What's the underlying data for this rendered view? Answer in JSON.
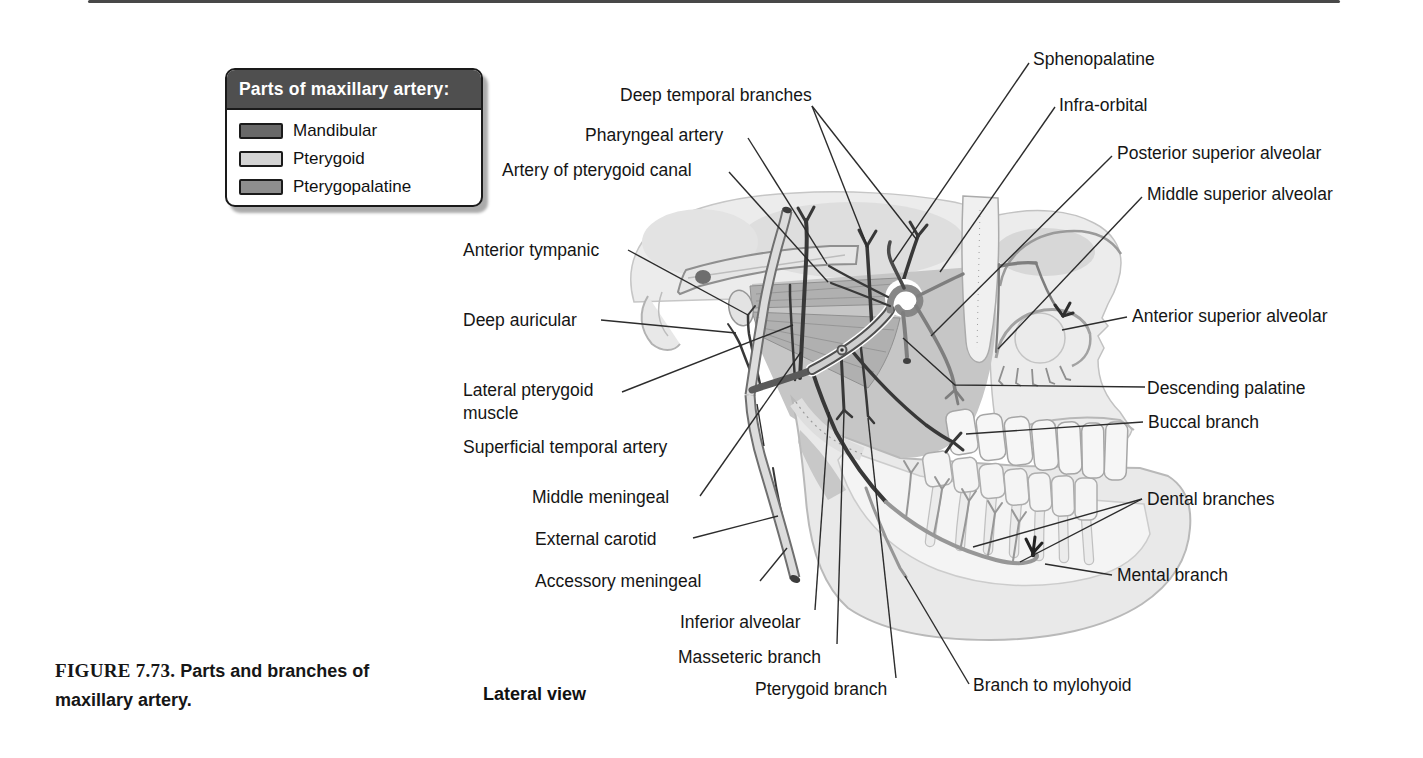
{
  "figure": {
    "number": "FIGURE 7.73.",
    "title": "Parts and branches of maxillary artery.",
    "view": "Lateral view"
  },
  "legend": {
    "title": "Parts of maxillary artery:",
    "items": [
      {
        "label": "Mandibular",
        "color": "#686868"
      },
      {
        "label": "Pterygoid",
        "color": "#d4d4d4"
      },
      {
        "label": "Pterygopalatine",
        "color": "#8e8e8e"
      }
    ]
  },
  "labels": [
    {
      "text": "Deep temporal branches"
    },
    {
      "text": "Pharyngeal artery"
    },
    {
      "text": "Artery of pterygoid canal"
    },
    {
      "text": "Sphenopalatine"
    },
    {
      "text": "Infra-orbital"
    },
    {
      "text": "Posterior superior alveolar"
    },
    {
      "text": "Middle superior alveolar"
    },
    {
      "text": "Anterior tympanic"
    },
    {
      "text": "Deep auricular"
    },
    {
      "text": "Anterior superior alveolar"
    },
    {
      "text": "Lateral pterygoid\nmuscle"
    },
    {
      "text": "Descending palatine"
    },
    {
      "text": "Buccal branch"
    },
    {
      "text": "Superficial temporal artery"
    },
    {
      "text": "Middle meningeal"
    },
    {
      "text": "External carotid"
    },
    {
      "text": "Accessory meningeal"
    },
    {
      "text": "Dental branches"
    },
    {
      "text": "Mental branch"
    },
    {
      "text": "Inferior alveolar"
    },
    {
      "text": "Masseteric branch"
    },
    {
      "text": "Pterygoid branch"
    },
    {
      "text": "Branch to mylohyoid"
    }
  ]
}
